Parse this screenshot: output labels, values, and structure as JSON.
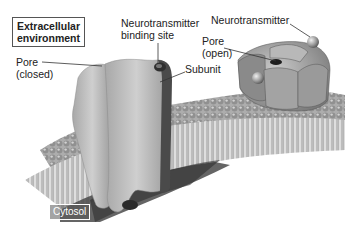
{
  "diagram": {
    "labels": {
      "extracellular": "Extracellular environment",
      "extracellular_line1": "Extracellular",
      "extracellular_line2": "environment",
      "pore_closed_line1": "Pore",
      "pore_closed_line2": "(closed)",
      "binding_site_line1": "Neurotransmitter",
      "binding_site_line2": "binding site",
      "subunit": "Subunit",
      "pore_open_line1": "Pore",
      "pore_open_line2": "(open)",
      "neurotransmitter": "Neurotransmitter",
      "cytosol": "Cytosol"
    },
    "colors": {
      "channel_light": "#c8c8c8",
      "channel_mid": "#9a9a9a",
      "channel_dark": "#5a5a5a",
      "membrane_head": "#8c8c8c",
      "membrane_tail": "#dcdcdc",
      "cytosol_dark": "#3a3a3a",
      "leader_line": "#333333"
    }
  }
}
